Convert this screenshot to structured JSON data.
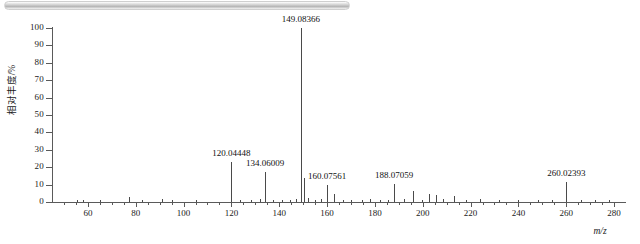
{
  "topbar": {
    "name": "scroll-bar"
  },
  "chart_data": {
    "type": "bar",
    "title": "",
    "xlabel": "m/z",
    "ylabel": "相对丰度/%",
    "xlim": [
      45,
      285
    ],
    "ylim": [
      0,
      100
    ],
    "grid": false,
    "legend": null,
    "xticks": [
      60,
      80,
      100,
      120,
      140,
      160,
      180,
      200,
      220,
      240,
      260,
      280
    ],
    "xtick_labels": [
      "60",
      "80",
      "100",
      "120",
      "140",
      "160",
      "180",
      "200",
      "220",
      "240",
      "260",
      "280"
    ],
    "yticks": [
      0,
      10,
      20,
      30,
      40,
      50,
      60,
      70,
      80,
      90,
      100
    ],
    "ytick_labels": [
      "0",
      "10",
      "20",
      "30",
      "40",
      "50",
      "60",
      "70",
      "80",
      "90",
      "100"
    ],
    "x": [
      55.5,
      58.0,
      65.2,
      77.0,
      82.5,
      91.1,
      95.0,
      105.0,
      120.04448,
      123.5,
      128.0,
      132.0,
      134.06009,
      137.5,
      141.0,
      144.5,
      147.0,
      149.08366,
      150.5,
      152.0,
      155.0,
      157.5,
      160.07561,
      163.0,
      166.5,
      170.0,
      174.5,
      178.0,
      182.0,
      185.5,
      188.07059,
      192.0,
      196.0,
      199.5,
      202.5,
      205.5,
      208.5,
      213.0,
      218.0,
      224.0,
      232.0,
      240.0,
      248.0,
      254.0,
      260.02393,
      266.0,
      272.0,
      278.0
    ],
    "values": [
      1.2,
      1.0,
      1.4,
      2.6,
      1.2,
      1.6,
      1.0,
      1.4,
      23.0,
      1.2,
      1.0,
      1.6,
      17.5,
      1.2,
      1.0,
      1.4,
      1.8,
      100.0,
      14.0,
      2.2,
      1.4,
      2.0,
      9.5,
      4.5,
      1.2,
      1.4,
      1.0,
      1.6,
      1.2,
      1.4,
      10.5,
      1.6,
      6.5,
      1.4,
      4.5,
      4.0,
      1.6,
      3.5,
      1.2,
      1.6,
      1.2,
      1.0,
      1.4,
      1.0,
      11.5,
      1.2,
      1.0,
      1.4
    ],
    "annotations": [
      {
        "mz": "120.04448",
        "x": 120.04448,
        "y": 23.0,
        "label_offset_y": 14
      },
      {
        "mz": "134.06009",
        "x": 134.06009,
        "y": 17.5,
        "label_offset_y": 14
      },
      {
        "mz": "149.08366",
        "x": 149.08366,
        "y": 100.0,
        "label_offset_y": 14
      },
      {
        "mz": "160.07561",
        "x": 160.07561,
        "y": 9.5,
        "label_offset_y": 14
      },
      {
        "mz": "188.07059",
        "x": 188.07059,
        "y": 10.5,
        "label_offset_y": 14
      },
      {
        "mz": "260.02393",
        "x": 260.02393,
        "y": 11.5,
        "label_offset_y": 14
      }
    ]
  }
}
